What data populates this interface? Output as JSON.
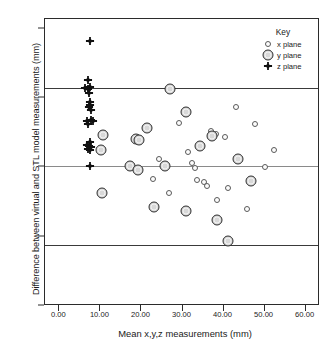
{
  "chart_data": {
    "type": "scatter",
    "title": "",
    "xlabel": "Mean x,y,z measurements (mm)",
    "ylabel": "Difference between virtual and STL model measurements (mm)",
    "xlim": [
      -3.5,
      63.5
    ],
    "ylim": [
      -1.0,
      1.07
    ],
    "xticks": [
      "0.00",
      "10.00",
      "20.00",
      "30.00",
      "40.00",
      "50.00",
      "60.00"
    ],
    "xtick_values": [
      0,
      10,
      20,
      30,
      40,
      50,
      60
    ],
    "yticks": [
      "1.00",
      "0.50",
      "0.00",
      "-0.50",
      "-1.00"
    ],
    "ytick_values": [
      1.0,
      0.5,
      0.0,
      -0.5,
      -1.0
    ],
    "grid": false,
    "legend_position": "top-right",
    "legend_title": "Key",
    "reference_lines": [
      {
        "name": "upper-limit-of-agreement",
        "value": 0.565,
        "style": "solid-dark"
      },
      {
        "name": "mean-difference",
        "value": 0.0,
        "style": "solid-gray"
      },
      {
        "name": "lower-limit-of-agreement",
        "value": -0.565,
        "style": "solid-dark"
      }
    ],
    "series": [
      {
        "name": "x plane",
        "marker": "small-open-circle",
        "points": [
          [
            29.4,
            0.315
          ],
          [
            31.6,
            0.105
          ],
          [
            32.6,
            0.025
          ],
          [
            33.2,
            -0.015
          ],
          [
            33.8,
            -0.095
          ],
          [
            35.5,
            -0.115
          ],
          [
            36.2,
            -0.145
          ],
          [
            37.2,
            0.255
          ],
          [
            38.3,
            0.235
          ],
          [
            38.6,
            -0.245
          ],
          [
            40.5,
            0.215
          ],
          [
            41.3,
            -0.155
          ],
          [
            43.2,
            0.43
          ],
          [
            46.0,
            -0.305
          ],
          [
            47.8,
            0.305
          ],
          [
            50.3,
            -0.005
          ],
          [
            52.6,
            0.115
          ],
          [
            27.0,
            -0.195
          ],
          [
            24.4,
            0.055
          ],
          [
            23.0,
            -0.09
          ],
          [
            19.8,
            0.195
          ],
          [
            26.2,
            -0.005
          ]
        ]
      },
      {
        "name": "y plane",
        "marker": "large-gray-circle",
        "points": [
          [
            10.9,
            0.225
          ],
          [
            10.4,
            0.115
          ],
          [
            10.6,
            -0.19
          ],
          [
            17.4,
            0.0
          ],
          [
            18.9,
            0.195
          ],
          [
            19.6,
            0.19
          ],
          [
            19.3,
            -0.025
          ],
          [
            21.5,
            0.275
          ],
          [
            23.2,
            -0.295
          ],
          [
            26.1,
            0.0
          ],
          [
            27.3,
            0.555
          ],
          [
            31.0,
            0.395
          ],
          [
            31.1,
            -0.325
          ],
          [
            34.4,
            0.15
          ],
          [
            37.4,
            0.22
          ],
          [
            38.7,
            -0.385
          ],
          [
            41.3,
            -0.535
          ],
          [
            43.8,
            0.05
          ],
          [
            47.0,
            -0.105
          ]
        ]
      },
      {
        "name": "z plane",
        "marker": "cross-plus",
        "points": [
          [
            7.7,
            0.905
          ],
          [
            7.1,
            0.625
          ],
          [
            6.5,
            0.565
          ],
          [
            7.3,
            0.56
          ],
          [
            7.8,
            0.575
          ],
          [
            7.4,
            0.53
          ],
          [
            7.6,
            0.465
          ],
          [
            7.8,
            0.445
          ],
          [
            7.5,
            0.425
          ],
          [
            7.9,
            0.41
          ],
          [
            7.0,
            0.325
          ],
          [
            7.9,
            0.335
          ],
          [
            8.4,
            0.325
          ],
          [
            7.2,
            0.305
          ],
          [
            7.6,
            0.175
          ],
          [
            7.0,
            0.155
          ],
          [
            7.5,
            0.145
          ],
          [
            8.0,
            0.14
          ],
          [
            7.3,
            0.125
          ],
          [
            7.8,
            0.115
          ],
          [
            7.6,
            0.0
          ]
        ]
      }
    ]
  },
  "legend": {
    "title": "Key",
    "entries": [
      {
        "label": "x plane",
        "marker": "small-open-circle"
      },
      {
        "label": "y plane",
        "marker": "large-gray-circle"
      },
      {
        "label": "z plane",
        "marker": "cross-plus"
      }
    ]
  }
}
